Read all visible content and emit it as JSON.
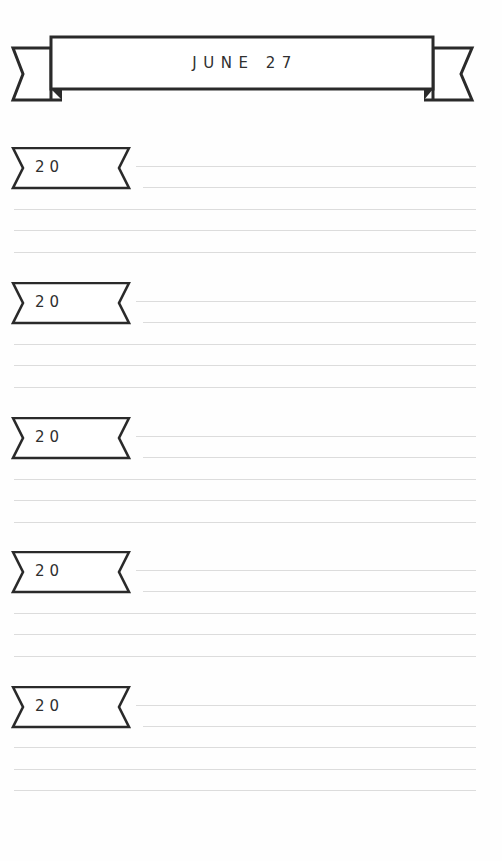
{
  "header": {
    "title": "JUNE 27"
  },
  "entries": [
    {
      "year_prefix": "20",
      "lines": 5
    },
    {
      "year_prefix": "20",
      "lines": 5
    },
    {
      "year_prefix": "20",
      "lines": 5
    },
    {
      "year_prefix": "20",
      "lines": 5
    },
    {
      "year_prefix": "20",
      "lines": 5
    }
  ],
  "colors": {
    "ink": "#2a2a2a",
    "rule": "#dcdcdc",
    "paper": "#fefefe"
  }
}
